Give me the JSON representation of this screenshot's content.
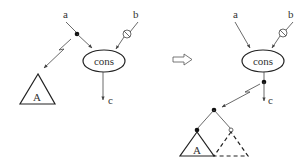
{
  "diagram": {
    "left": {
      "inputs": {
        "a": "a",
        "b": "b"
      },
      "node": "cons",
      "output": "c",
      "subtree": "A"
    },
    "transform_arrow": "⇨",
    "right": {
      "inputs": {
        "a": "a",
        "b": "b"
      },
      "node": "cons",
      "output": "c",
      "subtree_left": "A",
      "subtree_right": "R"
    },
    "colors": {
      "stroke": "#444444",
      "text": "#333333",
      "background": "#ffffff"
    }
  }
}
